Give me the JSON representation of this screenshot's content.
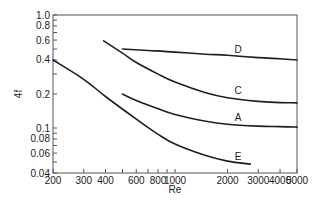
{
  "chart_data": {
    "type": "line",
    "title": "",
    "xlabel": "Re",
    "ylabel": "4f",
    "xscale": "log",
    "yscale": "log",
    "xlim": [
      200,
      5000
    ],
    "ylim": [
      0.04,
      1.0
    ],
    "grid": false,
    "legend": "inline curve labels",
    "x_ticks": [
      200,
      300,
      400,
      500,
      600,
      700,
      800,
      900,
      1000,
      2000,
      3000,
      4000,
      5000
    ],
    "x_tick_labels": [
      {
        "value": 200,
        "label": "200"
      },
      {
        "value": 300,
        "label": "300"
      },
      {
        "value": 400,
        "label": "400"
      },
      {
        "value": 600,
        "label": "600"
      },
      {
        "value": 800,
        "label": "800"
      },
      {
        "value": 1000,
        "label": "1000"
      },
      {
        "value": 2000,
        "label": "2000"
      },
      {
        "value": 3000,
        "label": "3000"
      },
      {
        "value": 4000,
        "label": "4000"
      },
      {
        "value": 5000,
        "label": "5000"
      }
    ],
    "y_ticks": [
      0.04,
      0.05,
      0.06,
      0.07,
      0.08,
      0.09,
      0.1,
      0.2,
      0.3,
      0.4,
      0.5,
      0.6,
      0.7,
      0.8,
      0.9,
      1.0
    ],
    "y_tick_labels": [
      {
        "value": 1.0,
        "label": "1.0"
      },
      {
        "value": 0.8,
        "label": "0.8"
      },
      {
        "value": 0.6,
        "label": "0.6"
      },
      {
        "value": 0.4,
        "label": "0.4"
      },
      {
        "value": 0.2,
        "label": "0.2"
      },
      {
        "value": 0.1,
        "label": "0.1"
      },
      {
        "value": 0.08,
        "label": "0.08"
      },
      {
        "value": 0.06,
        "label": "0.06"
      },
      {
        "value": 0.04,
        "label": "0.04"
      }
    ],
    "series": [
      {
        "name": "D",
        "label_at": {
          "x": 2300,
          "y": 0.46
        },
        "points": [
          [
            500,
            0.5
          ],
          [
            700,
            0.485
          ],
          [
            1000,
            0.47
          ],
          [
            1500,
            0.45
          ],
          [
            2000,
            0.44
          ],
          [
            3000,
            0.42
          ],
          [
            4000,
            0.41
          ],
          [
            5000,
            0.4
          ]
        ]
      },
      {
        "name": "C",
        "label_at": {
          "x": 2300,
          "y": 0.2
        },
        "points": [
          [
            390,
            0.59
          ],
          [
            500,
            0.46
          ],
          [
            600,
            0.38
          ],
          [
            800,
            0.3
          ],
          [
            1000,
            0.255
          ],
          [
            1500,
            0.205
          ],
          [
            2000,
            0.185
          ],
          [
            3000,
            0.172
          ],
          [
            4000,
            0.168
          ],
          [
            5000,
            0.167
          ]
        ]
      },
      {
        "name": "A",
        "label_at": {
          "x": 2300,
          "y": 0.115
        },
        "points": [
          [
            500,
            0.2
          ],
          [
            600,
            0.175
          ],
          [
            800,
            0.148
          ],
          [
            1000,
            0.132
          ],
          [
            1500,
            0.115
          ],
          [
            2000,
            0.108
          ],
          [
            3000,
            0.104
          ],
          [
            4000,
            0.103
          ],
          [
            5000,
            0.102
          ]
        ]
      },
      {
        "name": "E",
        "label_at": {
          "x": 2300,
          "y": 0.052
        },
        "points": [
          [
            200,
            0.4
          ],
          [
            300,
            0.27
          ],
          [
            400,
            0.19
          ],
          [
            600,
            0.12
          ],
          [
            800,
            0.088
          ],
          [
            1000,
            0.072
          ],
          [
            1500,
            0.057
          ],
          [
            2000,
            0.051
          ],
          [
            2700,
            0.048
          ]
        ]
      }
    ]
  },
  "axes": {
    "x_label": "Re",
    "y_label": "4f"
  }
}
